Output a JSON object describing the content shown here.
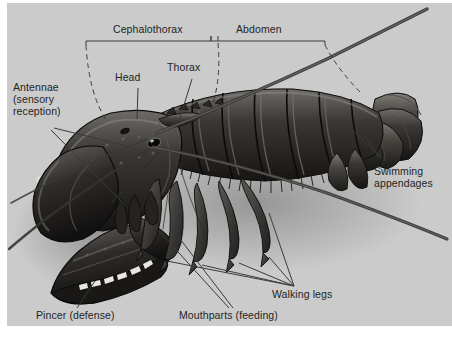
{
  "figure": {
    "kind": "anatomical-diagram",
    "background_color": "#cbcbcb",
    "text_color": "#242424",
    "leader_line_color": "#3a3a3a"
  },
  "brackets": [
    {
      "id": "cephalothorax",
      "label": "Cephalothorax"
    },
    {
      "id": "abdomen",
      "label": "Abdomen"
    }
  ],
  "labels": {
    "cephalothorax": "Cephalothorax",
    "abdomen": "Abdomen",
    "thorax": "Thorax",
    "head": "Head",
    "antennae_line1": "Antennae",
    "antennae_line2": "(sensory",
    "antennae_line3": "reception)",
    "swimming_line1": "Swimming",
    "swimming_line2": "appendages",
    "walking_legs": "Walking legs",
    "mouthparts": "Mouthparts (feeding)",
    "pincer": "Pincer (defense)"
  },
  "parts": [
    {
      "name": "Cephalothorax",
      "role": "body-region"
    },
    {
      "name": "Abdomen",
      "role": "body-region"
    },
    {
      "name": "Head",
      "role": "body-region"
    },
    {
      "name": "Thorax",
      "role": "body-region"
    },
    {
      "name": "Antennae (sensory reception)",
      "role": "appendage"
    },
    {
      "name": "Swimming appendages",
      "role": "appendage"
    },
    {
      "name": "Walking legs",
      "role": "appendage"
    },
    {
      "name": "Mouthparts (feeding)",
      "role": "appendage"
    },
    {
      "name": "Pincer (defense)",
      "role": "appendage"
    }
  ]
}
